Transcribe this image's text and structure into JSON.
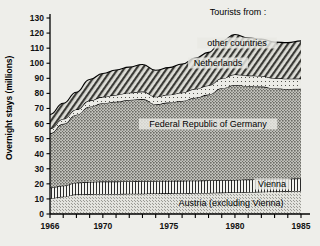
{
  "chart_data": {
    "type": "area",
    "stacked": true,
    "title": "",
    "legend_title": "Tourists from :",
    "legend_position": "in-plot-annotations",
    "xlabel": "",
    "ylabel": "Overnight stays  (millions)",
    "xlim": [
      1966,
      1985
    ],
    "ylim": [
      0,
      130
    ],
    "ytick_step": 10,
    "yticks": [
      0,
      10,
      20,
      30,
      40,
      50,
      60,
      70,
      80,
      90,
      100,
      110,
      120,
      130
    ],
    "ytick_labels": [
      "0",
      "10",
      "20",
      "30",
      "40",
      "50",
      "60",
      "70",
      "80",
      "90",
      "100",
      "110",
      "120",
      "130"
    ],
    "xticks_minor_every": 1,
    "xtick_labels": [
      "1966",
      "1970",
      "1975",
      "1980",
      "1985"
    ],
    "xtick_label_values": [
      1966,
      1970,
      1975,
      1980,
      1985
    ],
    "grid": false,
    "x": [
      1966,
      1967,
      1968,
      1969,
      1970,
      1971,
      1972,
      1973,
      1974,
      1975,
      1976,
      1977,
      1978,
      1979,
      1980,
      1981,
      1982,
      1983,
      1984,
      1985
    ],
    "series": [
      {
        "name": "Austria (excluding Vienna)",
        "label": "Austria (excluding Vienna)",
        "pattern": "fine-stipple",
        "color": "#d9d9d4",
        "values": [
          10.5,
          11.5,
          13.0,
          13.2,
          13.3,
          13.3,
          13.4,
          13.5,
          13.6,
          13.7,
          13.8,
          13.9,
          14.0,
          14.2,
          14.4,
          14.6,
          14.8,
          15.0,
          15.2,
          15.3
        ]
      },
      {
        "name": "Vienna",
        "label": "Vienna",
        "pattern": "vertical-lines",
        "color": "#f2f2ee",
        "values": [
          7.0,
          7.3,
          7.8,
          8.0,
          8.2,
          8.2,
          8.2,
          8.2,
          8.2,
          8.2,
          8.2,
          8.2,
          8.2,
          8.2,
          8.2,
          8.2,
          8.2,
          8.2,
          8.2,
          8.2
        ]
      },
      {
        "name": "Federal Republic of Germany",
        "label": "Federal Republic of Germany",
        "pattern": "coarse-stipple",
        "color": "#a8a8a2",
        "values": [
          36.0,
          41.0,
          45.0,
          50.0,
          52.0,
          53.0,
          54.0,
          54.5,
          51.0,
          52.0,
          53.0,
          55.0,
          57.0,
          61.0,
          63.0,
          62.0,
          61.5,
          60.0,
          59.5,
          59.5
        ]
      },
      {
        "name": "Netherlands",
        "label": "Netherlands",
        "pattern": "light-dots",
        "color": "#e2e2dd",
        "values": [
          3.0,
          3.2,
          3.5,
          4.0,
          4.2,
          4.5,
          4.8,
          5.0,
          5.0,
          5.2,
          5.5,
          5.8,
          6.0,
          6.5,
          7.0,
          7.0,
          7.0,
          6.8,
          6.8,
          6.8
        ]
      },
      {
        "name": "other countries",
        "label": "other countries",
        "pattern": "diagonal-hatch",
        "color": "#b8b8b2",
        "values": [
          9.5,
          10.5,
          11.5,
          14.0,
          15.5,
          16.5,
          17.0,
          18.0,
          17.5,
          18.0,
          19.0,
          20.5,
          22.0,
          25.0,
          26.5,
          25.0,
          24.5,
          24.0,
          24.0,
          25.0
        ]
      }
    ],
    "totals": [
      66.0,
      73.5,
      80.8,
      89.2,
      93.2,
      95.5,
      97.4,
      99.2,
      95.3,
      97.1,
      99.5,
      103.4,
      107.2,
      114.9,
      119.1,
      116.8,
      116.0,
      114.0,
      113.7,
      114.8
    ]
  },
  "annotations": {
    "legend_title": "Tourists from :",
    "other_countries": "other countries",
    "netherlands": "Netherlands",
    "germany": "Federal Republic of Germany",
    "vienna": "Vienna",
    "austria": "Austria (excluding Vienna)"
  }
}
